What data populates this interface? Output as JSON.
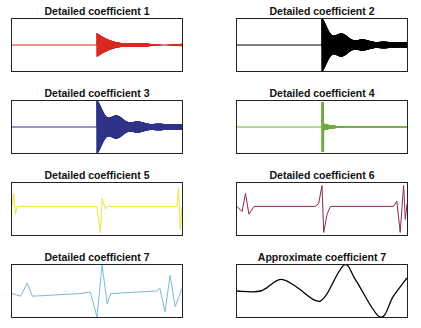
{
  "chart_data": [
    {
      "type": "line",
      "title": "Detailed coefficient 1",
      "color": "#d9281e",
      "shape": "burst",
      "burst_at": 0.5,
      "amp": 0.45,
      "decay": "fast",
      "xlabel": "",
      "ylabel": "",
      "grid": false
    },
    {
      "type": "line",
      "title": "Detailed coefficient 2",
      "color": "#000000",
      "shape": "burst",
      "burst_at": 0.5,
      "amp": 0.95,
      "decay": "slow",
      "grid": false
    },
    {
      "type": "line",
      "title": "Detailed coefficient 3",
      "color": "#2e3388",
      "shape": "burst",
      "burst_at": 0.5,
      "amp": 0.95,
      "decay": "slow",
      "grid": false
    },
    {
      "type": "line",
      "title": "Detailed coefficient 4",
      "color": "#6aab3a",
      "shape": "spike",
      "burst_at": 0.5,
      "amp": 0.95,
      "grid": false
    },
    {
      "type": "line",
      "title": "Detailed coefficient 5",
      "color": "#f0e23a",
      "shape": "wavelet",
      "grid": false,
      "points": [
        [
          0,
          0.45
        ],
        [
          0.01,
          0.2
        ],
        [
          0.02,
          0.6
        ],
        [
          0.03,
          0.45
        ],
        [
          0.5,
          0.45
        ],
        [
          0.51,
          0.7
        ],
        [
          0.52,
          0.95
        ],
        [
          0.53,
          0.3
        ],
        [
          0.55,
          0.5
        ],
        [
          0.56,
          0.45
        ],
        [
          0.97,
          0.45
        ],
        [
          0.98,
          0.1
        ],
        [
          0.99,
          0.9
        ],
        [
          1,
          0.45
        ]
      ]
    },
    {
      "type": "line",
      "title": "Detailed coefficient 6",
      "color": "#8a2b4a",
      "shape": "wavelet",
      "grid": false,
      "points": [
        [
          0,
          0.45
        ],
        [
          0.03,
          0.55
        ],
        [
          0.05,
          0.2
        ],
        [
          0.07,
          0.6
        ],
        [
          0.1,
          0.45
        ],
        [
          0.46,
          0.45
        ],
        [
          0.48,
          0.4
        ],
        [
          0.5,
          0.05
        ],
        [
          0.51,
          0.95
        ],
        [
          0.53,
          0.6
        ],
        [
          0.55,
          0.45
        ],
        [
          0.92,
          0.45
        ],
        [
          0.94,
          0.35
        ],
        [
          0.96,
          0.95
        ],
        [
          0.98,
          0.05
        ],
        [
          0.99,
          0.7
        ],
        [
          1,
          0.4
        ]
      ]
    },
    {
      "type": "line",
      "title": "Detailed coefficient 7",
      "color": "#7ab8d8",
      "shape": "wavelet",
      "grid": false,
      "points": [
        [
          0,
          0.55
        ],
        [
          0.05,
          0.6
        ],
        [
          0.09,
          0.35
        ],
        [
          0.12,
          0.6
        ],
        [
          0.4,
          0.55
        ],
        [
          0.46,
          0.52
        ],
        [
          0.5,
          1.0
        ],
        [
          0.53,
          0.0
        ],
        [
          0.56,
          0.75
        ],
        [
          0.58,
          0.55
        ],
        [
          0.85,
          0.5
        ],
        [
          0.87,
          0.45
        ],
        [
          0.9,
          0.9
        ],
        [
          0.93,
          0.2
        ],
        [
          0.96,
          0.8
        ],
        [
          1,
          0.45
        ]
      ]
    },
    {
      "type": "line",
      "title": "Approximate coefficient 7",
      "color": "#000000",
      "shape": "smooth",
      "grid": false,
      "points": [
        [
          0,
          0.5
        ],
        [
          0.14,
          0.5
        ],
        [
          0.25,
          0.28
        ],
        [
          0.34,
          0.4
        ],
        [
          0.46,
          0.68
        ],
        [
          0.52,
          0.6
        ],
        [
          0.63,
          0.0
        ],
        [
          0.7,
          0.3
        ],
        [
          0.84,
          1.0
        ],
        [
          0.92,
          0.6
        ],
        [
          1,
          0.25
        ]
      ]
    }
  ],
  "panels": [
    {
      "title": "Detailed coefficient 1"
    },
    {
      "title": "Detailed coefficient 2"
    },
    {
      "title": "Detailed coefficient 3"
    },
    {
      "title": "Detailed coefficient 4"
    },
    {
      "title": "Detailed coefficient 5"
    },
    {
      "title": "Detailed coefficient 6"
    },
    {
      "title": "Detailed coefficient 7"
    },
    {
      "title": "Approximate coefficient 7"
    }
  ]
}
